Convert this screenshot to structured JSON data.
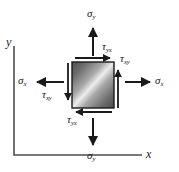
{
  "figure": {
    "name": "plane-stress-element",
    "background_color": "#ffffff",
    "ink_color": "#1a1a1a"
  },
  "axes": {
    "x_label": "x",
    "y_label": "y",
    "origin": [
      14,
      155
    ],
    "x_end": [
      142,
      155
    ],
    "y_end": [
      14,
      46
    ],
    "color": "#4d4d4d"
  },
  "element": {
    "name": "stress-square",
    "x": 72,
    "y": 62,
    "width": 42,
    "height": 46,
    "border_color": "#1a1a1a",
    "gradient_dark": "#4a4a4a",
    "gradient_light": "#e8e8e8",
    "gradient_angle_deg": 45
  },
  "stresses": [
    {
      "id": "sigma-y-top",
      "symbol": "σ",
      "subscript": "y",
      "kind": "normal",
      "face": "top",
      "direction": "up",
      "label_x": 87,
      "label_y": 8,
      "arrow": {
        "x1": 93,
        "y1": 56,
        "x2": 93,
        "y2": 27
      }
    },
    {
      "id": "sigma-y-bottom",
      "symbol": "σ",
      "subscript": "y",
      "kind": "normal",
      "face": "bottom",
      "direction": "down",
      "label_x": 87,
      "label_y": 152,
      "arrow": {
        "x1": 93,
        "y1": 118,
        "x2": 93,
        "y2": 146
      }
    },
    {
      "id": "sigma-x-left",
      "symbol": "σ",
      "subscript": "x",
      "kind": "normal",
      "face": "left",
      "direction": "left",
      "label_x": 18,
      "label_y": 75,
      "arrow": {
        "x1": 64,
        "y1": 82,
        "x2": 36,
        "y2": 82
      }
    },
    {
      "id": "sigma-x-right",
      "symbol": "σ",
      "subscript": "x",
      "kind": "normal",
      "face": "right",
      "direction": "right",
      "label_x": 155,
      "label_y": 75,
      "arrow": {
        "x1": 124,
        "y1": 82,
        "x2": 150,
        "y2": 82
      }
    },
    {
      "id": "tau-yx-top",
      "symbol": "τ",
      "subscript": "yx",
      "kind": "shear",
      "face": "top",
      "direction": "right",
      "label_x": 104,
      "label_y": 41,
      "arrow": {
        "x1": 74,
        "y1": 58,
        "x2": 111,
        "y2": 58
      }
    },
    {
      "id": "tau-yx-bottom",
      "symbol": "τ",
      "subscript": "yx",
      "kind": "shear",
      "face": "bottom",
      "direction": "left",
      "label_x": 69,
      "label_y": 115,
      "arrow": {
        "x1": 112,
        "y1": 112,
        "x2": 75,
        "y2": 112
      }
    },
    {
      "id": "tau-xy-right",
      "symbol": "τ",
      "subscript": "xy",
      "kind": "shear",
      "face": "right",
      "direction": "up",
      "label_x": 120,
      "label_y": 55,
      "arrow": {
        "x1": 118,
        "y1": 108,
        "x2": 118,
        "y2": 70
      }
    },
    {
      "id": "tau-xy-left",
      "symbol": "τ",
      "subscript": "xy",
      "kind": "shear",
      "face": "left",
      "direction": "down",
      "label_x": 44,
      "label_y": 90,
      "arrow": {
        "x1": 68,
        "y1": 62,
        "x2": 68,
        "y2": 100
      }
    }
  ]
}
